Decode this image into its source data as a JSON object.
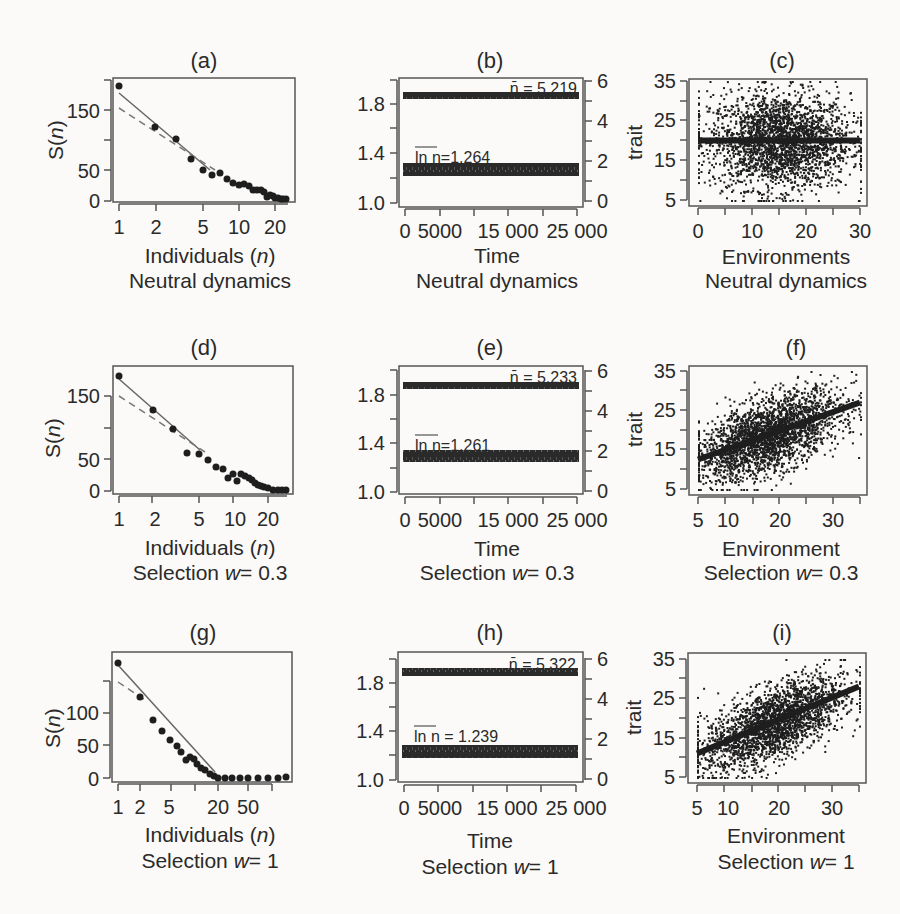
{
  "chart_data": [
    {
      "panel": "(a)",
      "type": "scatter",
      "title": "(a)",
      "xlabel": "Individuals (n)",
      "subtitle": "Neutral dynamics",
      "ylabel": "S(n)",
      "x_scale": "log",
      "xticks": [
        "1",
        "2",
        "5",
        "10",
        "20"
      ],
      "yticks": [
        "0",
        "50",
        "150"
      ],
      "ylim": [
        0,
        200
      ],
      "points": [
        [
          1,
          188
        ],
        [
          2,
          120
        ],
        [
          3,
          102
        ],
        [
          4,
          68
        ],
        [
          5,
          52
        ],
        [
          6,
          42
        ],
        [
          7,
          46
        ],
        [
          8,
          36
        ],
        [
          9,
          29
        ],
        [
          10,
          26
        ],
        [
          11,
          27
        ],
        [
          12,
          24
        ],
        [
          13,
          18
        ],
        [
          14,
          17
        ],
        [
          15,
          17
        ],
        [
          16,
          14
        ],
        [
          17,
          6
        ],
        [
          18,
          9
        ],
        [
          19,
          8
        ],
        [
          20,
          5
        ],
        [
          21,
          4
        ],
        [
          22,
          3
        ],
        [
          23,
          2
        ],
        [
          24,
          2
        ]
      ],
      "lines": [
        {
          "style": "solid",
          "from": [
            1,
            178
          ],
          "to": [
            7,
            44
          ]
        },
        {
          "style": "dashed",
          "from": [
            1,
            155
          ],
          "to": [
            7,
            46
          ]
        }
      ]
    },
    {
      "panel": "(b)",
      "type": "line",
      "title": "(b)",
      "xlabel": "Time",
      "subtitle": "Neutral dynamics",
      "xticks": [
        "0",
        "5000",
        "15 000",
        "25 000"
      ],
      "yticks_left": [
        "1.0",
        "1.4",
        "1.8"
      ],
      "yticks_right": [
        "0",
        "2",
        "4",
        "6"
      ],
      "ylim_left": [
        1.0,
        2.0
      ],
      "ylim_right": [
        0,
        6
      ],
      "series": [
        {
          "name": "n̄ = 5.219",
          "level_right": 5.219
        },
        {
          "name": "ln n (mean) = 1.264",
          "level_left": 1.264
        }
      ],
      "annotations": [
        "n̄ = 5.219",
        "ln n = 1.264"
      ]
    },
    {
      "panel": "(c)",
      "type": "scatter",
      "title": "(c)",
      "xlabel": "Environments",
      "subtitle": "Neutral dynamics",
      "ylabel": "trait",
      "xticks": [
        "0",
        "10",
        "20",
        "30"
      ],
      "yticks": [
        "5",
        "15",
        "25",
        "35"
      ],
      "xlim": [
        -1,
        31
      ],
      "ylim": [
        4,
        36
      ],
      "description": "dense cloud centered on env 6–24, trait 8–30, with horizontal band at trait ≈ 20"
    },
    {
      "panel": "(d)",
      "type": "scatter",
      "title": "(d)",
      "xlabel": "Individuals (n)",
      "subtitle": "Selection w = 0.3",
      "ylabel": "S(n)",
      "x_scale": "log",
      "xticks": [
        "1",
        "2",
        "5",
        "10",
        "20"
      ],
      "yticks": [
        "0",
        "50",
        "150"
      ],
      "ylim": [
        0,
        200
      ],
      "points": [
        [
          1,
          185
        ],
        [
          2,
          128
        ],
        [
          3,
          100
        ],
        [
          4,
          62
        ],
        [
          5,
          60
        ],
        [
          6,
          50
        ],
        [
          7,
          40
        ],
        [
          8,
          38
        ],
        [
          9,
          22
        ],
        [
          10,
          27
        ],
        [
          11,
          16
        ],
        [
          12,
          27
        ],
        [
          13,
          24
        ],
        [
          14,
          21
        ],
        [
          15,
          19
        ],
        [
          16,
          14
        ],
        [
          17,
          12
        ],
        [
          18,
          10
        ],
        [
          19,
          8
        ],
        [
          20,
          6
        ],
        [
          22,
          3
        ],
        [
          24,
          2
        ],
        [
          26,
          2
        ],
        [
          28,
          2
        ]
      ],
      "lines": [
        {
          "style": "solid",
          "from": [
            1,
            180
          ],
          "to": [
            6,
            50
          ]
        },
        {
          "style": "dashed",
          "from": [
            1,
            152
          ],
          "to": [
            6,
            52
          ]
        }
      ]
    },
    {
      "panel": "(e)",
      "type": "line",
      "title": "(e)",
      "xlabel": "Time",
      "subtitle": "Selection w = 0.3",
      "xticks": [
        "0",
        "5000",
        "15 000",
        "25 000"
      ],
      "yticks_left": [
        "1.0",
        "1.4",
        "1.8"
      ],
      "yticks_right": [
        "0",
        "2",
        "4",
        "6"
      ],
      "ylim_left": [
        1.0,
        2.0
      ],
      "ylim_right": [
        0,
        6
      ],
      "series": [
        {
          "name": "n̄ = 5.233",
          "level_right": 5.233
        },
        {
          "name": "ln n (mean) = 1.261",
          "level_left": 1.261
        }
      ],
      "annotations": [
        "n̄ = 5.233",
        "ln n = 1.261"
      ]
    },
    {
      "panel": "(f)",
      "type": "scatter",
      "title": "(f)",
      "xlabel": "Environment",
      "subtitle": "Selection w = 0.3",
      "ylabel": "trait",
      "xticks": [
        "5",
        "10",
        "20",
        "30"
      ],
      "yticks": [
        "5",
        "15",
        "25",
        "35"
      ],
      "xlim": [
        4,
        36
      ],
      "ylim": [
        4,
        36
      ],
      "trend": {
        "from": [
          5,
          12.5
        ],
        "to": [
          35,
          27
        ]
      }
    },
    {
      "panel": "(g)",
      "type": "scatter",
      "title": "(g)",
      "xlabel": "Individuals (n)",
      "subtitle": "Selection w = 1",
      "ylabel": "S(n)",
      "x_scale": "log",
      "xticks": [
        "1",
        "2",
        "5",
        "20",
        "50"
      ],
      "yticks": [
        "0",
        "50",
        "100"
      ],
      "ylim": [
        0,
        180
      ],
      "points": [
        [
          1,
          170
        ],
        [
          2,
          125
        ],
        [
          3,
          90
        ],
        [
          4,
          75
        ],
        [
          5,
          60
        ],
        [
          6,
          45
        ],
        [
          7,
          40
        ],
        [
          8,
          30
        ],
        [
          9,
          32
        ],
        [
          10,
          30
        ],
        [
          11,
          25
        ],
        [
          12,
          20
        ],
        [
          13,
          18
        ],
        [
          15,
          12
        ],
        [
          17,
          10
        ],
        [
          20,
          2
        ],
        [
          25,
          2
        ],
        [
          30,
          2
        ],
        [
          40,
          2
        ],
        [
          50,
          2
        ],
        [
          70,
          2
        ],
        [
          100,
          2
        ],
        [
          140,
          2
        ]
      ],
      "lines": [
        {
          "style": "solid",
          "from": [
            1,
            165
          ],
          "to": [
            10,
            25
          ]
        },
        {
          "style": "dashed",
          "from": [
            1,
            145
          ],
          "to": [
            3,
            100
          ]
        }
      ]
    },
    {
      "panel": "(h)",
      "type": "line",
      "title": "(h)",
      "xlabel": "Time",
      "subtitle": "Selection w = 1",
      "xticks": [
        "0",
        "5000",
        "15 000",
        "25 000"
      ],
      "yticks_left": [
        "1.0",
        "1.4",
        "1.8"
      ],
      "yticks_right": [
        "0",
        "2",
        "4",
        "6"
      ],
      "ylim_left": [
        1.0,
        2.0
      ],
      "ylim_right": [
        0,
        6
      ],
      "series": [
        {
          "name": "n̄ = 5.322",
          "level_right": 5.322
        },
        {
          "name": "ln n (mean) = 1.239",
          "level_left": 1.239
        }
      ],
      "annotations": [
        "n̄ = 5.322",
        "ln n = 1.239"
      ]
    },
    {
      "panel": "(i)",
      "type": "scatter",
      "title": "(i)",
      "xlabel": "Environment",
      "subtitle": "Selection w = 1",
      "ylabel": "trait",
      "xticks": [
        "5",
        "10",
        "20",
        "30"
      ],
      "yticks": [
        "5",
        "15",
        "25",
        "35"
      ],
      "xlim": [
        4,
        36
      ],
      "ylim": [
        4,
        36
      ],
      "trend": {
        "from": [
          5,
          11
        ],
        "to": [
          35,
          28
        ]
      }
    }
  ],
  "panels": {
    "a": {
      "title": "(a)",
      "ylabel": "S(n)",
      "xlabel": "Individuals (",
      "xlabel_var": "n",
      "xlabel_end": ")",
      "subtitle": "Neutral dynamics",
      "xticks": [
        "1",
        "2",
        "5",
        "10",
        "20"
      ],
      "yticks": [
        "0",
        "50",
        "150"
      ]
    },
    "b": {
      "title": "(b)",
      "xlabel": "Time",
      "subtitle": "Neutral dynamics",
      "xticks": [
        "0",
        "5000",
        "15 000",
        "25 000"
      ],
      "yticks_left": [
        "1.0",
        "1.4",
        "1.8"
      ],
      "yticks_right": [
        "0",
        "2",
        "4",
        "6"
      ],
      "ann_top": "n̄ = 5.219",
      "ann_bottom": "ln n=1.264"
    },
    "c": {
      "title": "(c)",
      "ylabel": "trait",
      "xlabel": "Environments",
      "subtitle": "Neutral dynamics",
      "xticks": [
        "0",
        "10",
        "20",
        "30"
      ],
      "yticks": [
        "5",
        "15",
        "25",
        "35"
      ]
    },
    "d": {
      "title": "(d)",
      "ylabel": "S(n)",
      "xlabel": "Individuals (",
      "xlabel_var": "n",
      "xlabel_end": ")",
      "subtitle": "Selection ",
      "subtitle_var": "w",
      "subtitle_end": "= 0.3",
      "xticks": [
        "1",
        "2",
        "5",
        "10",
        "20"
      ],
      "yticks": [
        "0",
        "50",
        "150"
      ]
    },
    "e": {
      "title": "(e)",
      "xlabel": "Time",
      "subtitle": "Selection ",
      "subtitle_var": "w",
      "subtitle_end": "= 0.3",
      "xticks": [
        "0",
        "5000",
        "15 000",
        "25 000"
      ],
      "yticks_left": [
        "1.0",
        "1.4",
        "1.8"
      ],
      "yticks_right": [
        "0",
        "2",
        "4",
        "6"
      ],
      "ann_top": "n̄ = 5.233",
      "ann_bottom": "ln n=1.261"
    },
    "f": {
      "title": "(f)",
      "ylabel": "trait",
      "xlabel": "Environment",
      "subtitle": "Selection ",
      "subtitle_var": "w",
      "subtitle_end": "= 0.3",
      "xticks": [
        "5",
        "10",
        "20",
        "30"
      ],
      "yticks": [
        "5",
        "15",
        "25",
        "35"
      ]
    },
    "g": {
      "title": "(g)",
      "ylabel": "S(n)",
      "xlabel": "Individuals (",
      "xlabel_var": "n",
      "xlabel_end": ")",
      "subtitle": "Selection ",
      "subtitle_var": "w",
      "subtitle_end": "= 1",
      "xticks": [
        "1",
        "2",
        "5",
        "20",
        "50"
      ],
      "yticks": [
        "0",
        "50",
        "100"
      ]
    },
    "h": {
      "title": "(h)",
      "xlabel": "Time",
      "subtitle": "Selection ",
      "subtitle_var": "w",
      "subtitle_end": "= 1",
      "xticks": [
        "0",
        "5000",
        "15 000",
        "25 000"
      ],
      "yticks_left": [
        "1.0",
        "1.4",
        "1.8"
      ],
      "yticks_right": [
        "0",
        "2",
        "4",
        "6"
      ],
      "ann_top": "n̄ = 5.322",
      "ann_bottom": "ln n = 1.239"
    },
    "i": {
      "title": "(i)",
      "ylabel": "trait",
      "xlabel": "Environment",
      "subtitle": "Selection ",
      "subtitle_var": "w",
      "subtitle_end": "= 1",
      "xticks": [
        "5",
        "10",
        "20",
        "30"
      ],
      "yticks": [
        "5",
        "15",
        "25",
        "35"
      ]
    }
  },
  "colors": {
    "ink": "#2a2a2a",
    "axis": "#555555",
    "points": "#1e1e1e",
    "background": "#fbfaf8"
  }
}
